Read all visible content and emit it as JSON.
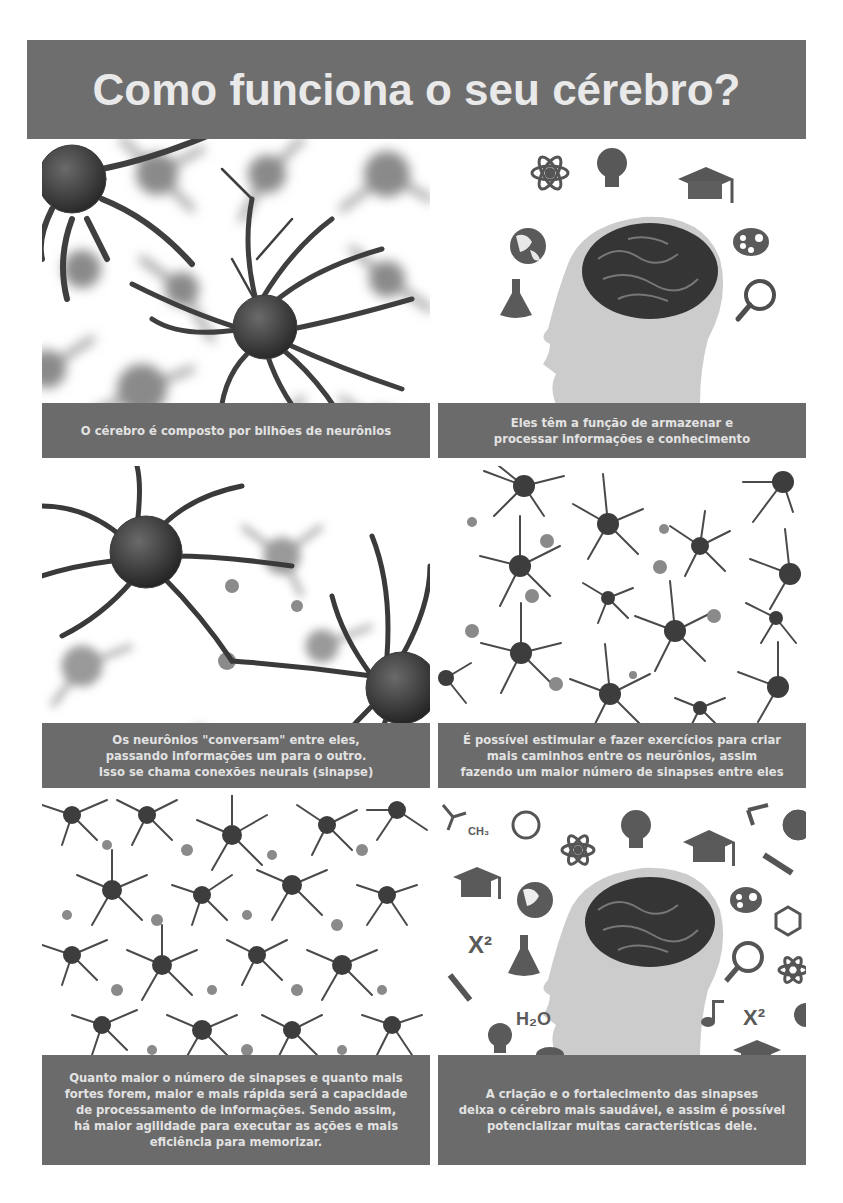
{
  "header": {
    "title": "Como funciona o seu cérebro?"
  },
  "panels": [
    {
      "image": "neurons-closeup-blurred",
      "caption": "O cérebro é composto por bilhões de neurônios"
    },
    {
      "image": "head-silhouette-brain-with-icons",
      "icons": [
        "atom-icon",
        "lightbulb-icon",
        "graduation-cap-icon",
        "globe-icon",
        "palette-icon",
        "flask-icon",
        "magnifier-icon"
      ],
      "caption": "Eles têm a função de armazenar e\nprocessar informações e conhecimento"
    },
    {
      "image": "neurons-connecting-synapse",
      "caption": "Os neurônios \"conversam\" entre eles,\npassando informações um para o outro.\nIsso se chama conexões neurais (sinapse)"
    },
    {
      "image": "neuron-network-sparse",
      "caption": "É possível estimular e fazer exercícios para criar\nmais caminhos entre os neurônios, assim\nfazendo um maior número de sinapses entre eles"
    },
    {
      "image": "neuron-network-dense",
      "caption": "Quanto maior o número de sinapses e quanto mais\nfortes forem, maior e mais rápida será a capacidade\nde processamento de informações. Sendo assim,\nhá maior agilidade para executar as ações e mais\neficiência para memorizar."
    },
    {
      "image": "head-silhouette-brain-with-many-icons",
      "icons": [
        "chemistry-ch3-icon",
        "ring-icon",
        "atom-icon",
        "lightbulb-icon",
        "graduation-cap-icon",
        "globe-icon",
        "ruler-icon",
        "palette-icon",
        "benzene-icon",
        "x-squared-icon",
        "flask-icon",
        "magnifier-icon",
        "music-note-icon",
        "h2o-icon"
      ],
      "labels": {
        "x2": "X²",
        "h2o": "H₂O",
        "ch3": "CH₃"
      },
      "caption": "A criação e o fortalecimento das sinapses\ndeixa o cérebro mais saudável, e assim é possível\npotencializar muitas características dele."
    }
  ],
  "colors": {
    "banner": "#6e6e6e",
    "caption_bg": "#6b6b6b",
    "caption_text": "#e2e2e2",
    "neuron_dark": "#3a3a3a",
    "head": "#c9c9c9",
    "brain": "#333333"
  }
}
